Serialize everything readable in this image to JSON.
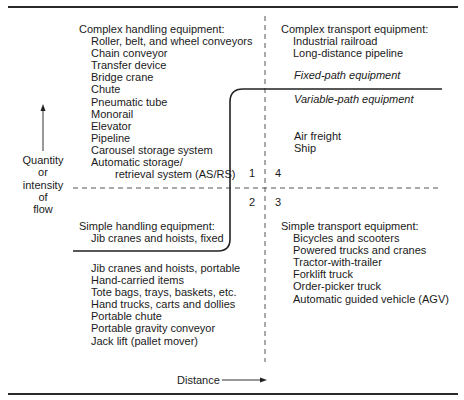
{
  "diagram": {
    "quadrants": {
      "q1_complex_handling": {
        "header": "Complex handling equipment:",
        "items": [
          "Roller, belt, and wheel conveyors",
          "Chain conveyor",
          "Transfer device",
          "Bridge crane",
          "Chute",
          "Pneumatic tube",
          "Monorail",
          "Elevator",
          "Pipeline",
          "Carousel storage system",
          "Automatic storage/",
          "retrieval system (AS/RS)"
        ]
      },
      "q4_complex_transport": {
        "header": "Complex transport equipment:",
        "items": [
          "Industrial railroad",
          "Long-distance pipeline"
        ],
        "fixed_path_label": "Fixed-path equipment",
        "variable_path_label": "Variable-path equipment",
        "variable_items": [
          "Air freight",
          "Ship"
        ]
      },
      "q2_simple_handling": {
        "header": "Simple handling equipment:",
        "fixed_items": [
          "Jib cranes and hoists, fixed"
        ],
        "items": [
          "Jib cranes and hoists, portable",
          "Hand-carried items",
          "Tote bags, trays, baskets, etc.",
          "Hand trucks, carts and dollies",
          "Portable chute",
          "Portable gravity conveyor",
          "Jack lift (pallet mover)"
        ]
      },
      "q3_simple_transport": {
        "header": "Simple transport equipment:",
        "items": [
          "Bicycles and scooters",
          "Powered trucks and cranes",
          "Tractor-with-trailer",
          "Forklift truck",
          "Order-picker truck",
          "Automatic guided vehicle (AGV)"
        ]
      }
    },
    "quadrant_numbers": [
      "1",
      "2",
      "3",
      "4"
    ],
    "y_axis": {
      "label_lines": [
        "Quantity",
        "or",
        "intensity",
        "of",
        "flow"
      ],
      "arrow": "up"
    },
    "x_axis": {
      "label": "Distance",
      "arrow": "right"
    },
    "colors": {
      "line": "#2a2a2a",
      "text": "#1a1a1a",
      "background": "#ffffff"
    }
  }
}
